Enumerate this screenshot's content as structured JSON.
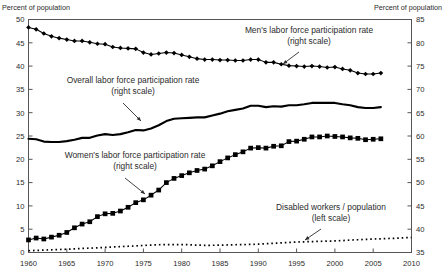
{
  "chart_data": {
    "type": "line",
    "title": "",
    "subtitle": "",
    "xlabel": "",
    "left_axis_title": "Percent of population",
    "right_axis_title": "Percent of population",
    "xlim": [
      1960,
      2010
    ],
    "xticks": [
      1960,
      1965,
      1970,
      1975,
      1980,
      1985,
      1990,
      1995,
      2000,
      2005,
      2010
    ],
    "xtick_labels": [
      "1960",
      "1965",
      "1970",
      "1975",
      "1980",
      "1985",
      "1990",
      "1995",
      "2000",
      "2005",
      "2010"
    ],
    "left_ylim": [
      0,
      50
    ],
    "left_yticks": [
      0,
      5,
      10,
      15,
      20,
      25,
      30,
      35,
      40,
      45,
      50
    ],
    "left_ytick_labels": [
      "0",
      "5",
      "10",
      "15",
      "20",
      "25",
      "30",
      "35",
      "40",
      "45",
      "50"
    ],
    "right_ylim": [
      35,
      85
    ],
    "right_yticks": [
      35,
      40,
      45,
      50,
      55,
      60,
      65,
      70,
      75,
      80,
      85
    ],
    "right_ytick_labels": [
      "35",
      "40",
      "45",
      "50",
      "55",
      "60",
      "65",
      "70",
      "75",
      "80",
      "85"
    ],
    "grid": false,
    "legend_position": "inline-annotations",
    "series": [
      {
        "name": "Men's labor force participation rate",
        "axis": "right",
        "marker": "diamond",
        "style": "thin-line-with-markers",
        "x": [
          1960,
          1961,
          1962,
          1963,
          1964,
          1965,
          1966,
          1967,
          1968,
          1969,
          1970,
          1971,
          1972,
          1973,
          1974,
          1975,
          1976,
          1977,
          1978,
          1979,
          1980,
          1981,
          1982,
          1983,
          1984,
          1985,
          1986,
          1987,
          1988,
          1989,
          1990,
          1991,
          1992,
          1993,
          1994,
          1995,
          1996,
          1997,
          1998,
          1999,
          2000,
          2001,
          2002,
          2003,
          2004,
          2005,
          2006
        ],
        "values": [
          83.3,
          82.9,
          82.0,
          81.4,
          81.0,
          80.7,
          80.4,
          80.4,
          80.1,
          79.8,
          79.7,
          79.1,
          78.9,
          78.8,
          78.7,
          77.9,
          77.5,
          77.7,
          77.9,
          77.8,
          77.4,
          77.0,
          76.6,
          76.4,
          76.4,
          76.3,
          76.3,
          76.2,
          76.2,
          76.4,
          76.4,
          75.8,
          75.8,
          75.4,
          75.1,
          75.0,
          74.9,
          75.0,
          74.9,
          74.7,
          74.8,
          74.4,
          74.1,
          73.5,
          73.3,
          73.3,
          73.5
        ]
      },
      {
        "name": "Overall labor force participation rate",
        "axis": "right",
        "marker": "none",
        "style": "thick-line",
        "x": [
          1960,
          1961,
          1962,
          1963,
          1964,
          1965,
          1966,
          1967,
          1968,
          1969,
          1970,
          1971,
          1972,
          1973,
          1974,
          1975,
          1976,
          1977,
          1978,
          1979,
          1980,
          1981,
          1982,
          1983,
          1984,
          1985,
          1986,
          1987,
          1988,
          1989,
          1990,
          1991,
          1992,
          1993,
          1994,
          1995,
          1996,
          1997,
          1998,
          1999,
          2000,
          2001,
          2002,
          2003,
          2004,
          2005,
          2006
        ],
        "values": [
          59.4,
          59.3,
          58.8,
          58.7,
          58.7,
          58.9,
          59.2,
          59.6,
          59.6,
          60.1,
          60.4,
          60.2,
          60.4,
          60.8,
          61.3,
          61.2,
          61.6,
          62.3,
          63.2,
          63.7,
          63.8,
          63.9,
          64.0,
          64.0,
          64.4,
          64.8,
          65.3,
          65.6,
          65.9,
          66.5,
          66.5,
          66.2,
          66.4,
          66.3,
          66.6,
          66.6,
          66.8,
          67.1,
          67.1,
          67.1,
          67.1,
          66.8,
          66.6,
          66.2,
          66.0,
          66.0,
          66.2
        ]
      },
      {
        "name": "Women's labor force participation rate",
        "axis": "right",
        "marker": "square",
        "style": "line-with-markers",
        "x": [
          1960,
          1961,
          1962,
          1963,
          1964,
          1965,
          1966,
          1967,
          1968,
          1969,
          1970,
          1971,
          1972,
          1973,
          1974,
          1975,
          1976,
          1977,
          1978,
          1979,
          1980,
          1981,
          1982,
          1983,
          1984,
          1985,
          1986,
          1987,
          1988,
          1989,
          1990,
          1991,
          1992,
          1993,
          1994,
          1995,
          1996,
          1997,
          1998,
          1999,
          2000,
          2001,
          2002,
          2003,
          2004,
          2005,
          2006
        ],
        "values": [
          37.7,
          38.1,
          37.9,
          38.3,
          38.7,
          39.3,
          40.3,
          41.1,
          41.6,
          42.7,
          43.3,
          43.4,
          43.9,
          44.7,
          45.7,
          46.3,
          47.3,
          48.4,
          50.0,
          50.9,
          51.5,
          52.1,
          52.6,
          52.9,
          53.6,
          54.5,
          55.3,
          56.0,
          56.6,
          57.4,
          57.5,
          57.4,
          57.8,
          57.9,
          58.8,
          58.9,
          59.3,
          59.8,
          59.8,
          60.0,
          59.9,
          59.8,
          59.6,
          59.5,
          59.2,
          59.3,
          59.4
        ]
      },
      {
        "name": "Disabled workers / population",
        "axis": "left",
        "marker": "none",
        "style": "dotted-line",
        "x": [
          1960,
          1961,
          1962,
          1963,
          1964,
          1965,
          1966,
          1967,
          1968,
          1969,
          1970,
          1971,
          1972,
          1973,
          1974,
          1975,
          1976,
          1977,
          1978,
          1979,
          1980,
          1981,
          1982,
          1983,
          1984,
          1985,
          1986,
          1987,
          1988,
          1989,
          1990,
          1991,
          1992,
          1993,
          1994,
          1995,
          1996,
          1997,
          1998,
          1999,
          2000,
          2001,
          2002,
          2003,
          2004,
          2005,
          2006,
          2007,
          2008,
          2009,
          2010
        ],
        "values": [
          0.38,
          0.45,
          0.52,
          0.58,
          0.64,
          0.7,
          0.78,
          0.86,
          0.94,
          1.0,
          1.08,
          1.18,
          1.26,
          1.34,
          1.42,
          1.52,
          1.6,
          1.66,
          1.7,
          1.7,
          1.7,
          1.66,
          1.58,
          1.55,
          1.55,
          1.58,
          1.62,
          1.66,
          1.7,
          1.74,
          1.8,
          1.88,
          1.98,
          2.08,
          2.16,
          2.24,
          2.3,
          2.34,
          2.4,
          2.44,
          2.48,
          2.56,
          2.66,
          2.74,
          2.82,
          2.88,
          2.94,
          3.0,
          3.06,
          3.16,
          3.22
        ]
      }
    ],
    "annotations": [
      {
        "id": "men-annotation",
        "lines": [
          "Men's labor force participation rate",
          "(right scale)"
        ],
        "text_x": 309,
        "text_y": 33,
        "arrow": {
          "x1": 299,
          "y1": 52,
          "x2": 283,
          "y2": 64
        }
      },
      {
        "id": "overall-annotation",
        "lines": [
          "Overall labor force participation rate",
          "(right scale)"
        ],
        "text_x": 133,
        "text_y": 83,
        "arrow": {
          "x1": 123,
          "y1": 103,
          "x2": 141,
          "y2": 121
        }
      },
      {
        "id": "women-annotation",
        "lines": [
          "Women's labor force participation rate",
          "(right scale)"
        ],
        "text_x": 135,
        "text_y": 158,
        "arrow": {
          "x1": 125,
          "y1": 178,
          "x2": 145,
          "y2": 194
        }
      },
      {
        "id": "disabled-annotation",
        "lines": [
          "Disabled workers / population",
          "(left scale)"
        ],
        "text_x": 331,
        "text_y": 210,
        "arrow": {
          "x1": 321,
          "y1": 229,
          "x2": 305,
          "y2": 240
        }
      }
    ]
  }
}
